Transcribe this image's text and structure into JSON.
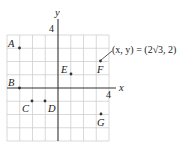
{
  "diagram": {
    "axes": {
      "x_label": "x",
      "y_label": "y",
      "x_tick_label": "4",
      "y_tick_label": "4",
      "range": {
        "xmin": -4,
        "xmax": 4,
        "ymin": -4,
        "ymax": 4
      }
    },
    "grid": {
      "on": true,
      "step": 1
    },
    "points": [
      {
        "label": "A",
        "x": -3,
        "y": 3
      },
      {
        "label": "B",
        "x": -3,
        "y": 0
      },
      {
        "label": "C",
        "x": -2,
        "y": -1
      },
      {
        "label": "D",
        "x": -1,
        "y": -1
      },
      {
        "label": "E",
        "x": 1,
        "y": 1
      },
      {
        "label": "F",
        "x": 3.46,
        "y": 2
      },
      {
        "label": "G",
        "x": 3.46,
        "y": -2
      }
    ],
    "annotation": {
      "text": "(x, y) = (2√3, 2)",
      "points_to": "F"
    }
  }
}
